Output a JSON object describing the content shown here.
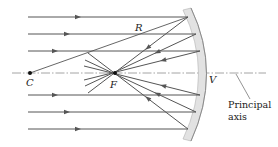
{
  "figure": {
    "labels": {
      "center": "C",
      "focus": "F",
      "vertex": "V",
      "radius": "R",
      "axis_line1": "Principal",
      "axis_line2": "axis"
    },
    "colors": {
      "ray": "#555555",
      "mirror_fill": "#e2e2e2",
      "mirror_edge": "#888888",
      "axis": "#999999",
      "text": "#222222"
    },
    "geometry": {
      "axis_y": 73,
      "center_x": 30,
      "focus_x": 115,
      "vertex_x": 205,
      "incoming_ray_ys": [
        17,
        34,
        51,
        95,
        112,
        129
      ]
    }
  }
}
